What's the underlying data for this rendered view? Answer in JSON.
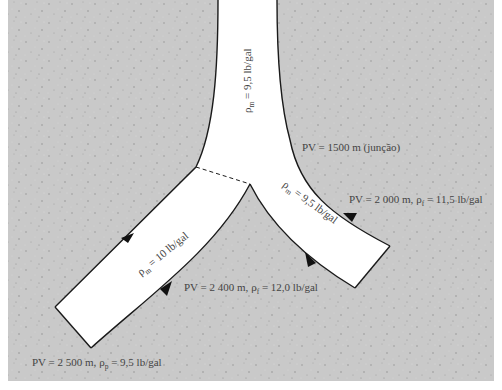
{
  "diagram": {
    "colors": {
      "formation": "#c9c9c9",
      "wellbore": "#ffffff",
      "outline": "#1a1a1a",
      "text": "#444444",
      "speckle": "#9a9a9a"
    },
    "labels": {
      "main_bore": {
        "rho": "ρ",
        "sub": "m",
        "rest": " = 9,5 lb/gal"
      },
      "junction": "PV = 1500 m (junção)",
      "right_branch_fluid": {
        "rho": "ρ",
        "sub": "m",
        "rest": " = 9,5 lb/gal"
      },
      "right_branch_end": {
        "pre": "PV = 2 000 m, ",
        "rho": "ρ",
        "sub": "f",
        "rest": " = 11,5 lb/gal"
      },
      "left_branch_fluid": {
        "rho": "ρ",
        "sub": "m",
        "rest": " = 10 lb/gal"
      },
      "left_branch_mid": {
        "pre": "PV = 2 400 m, ",
        "rho": "ρ",
        "sub": "f",
        "rest": " = 12,0 lb/gal"
      },
      "left_branch_end": {
        "pre": "PV = 2 500 m, ",
        "rho": "ρ",
        "sub": "p",
        "rest": " = 9,5 lb/gal"
      }
    }
  }
}
